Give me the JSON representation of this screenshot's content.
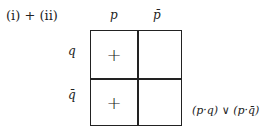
{
  "heading": "(i) + (ii)",
  "columns": [
    "p",
    "p̄"
  ],
  "rows": [
    "q",
    "q̄"
  ],
  "cells": [
    [
      "+",
      ""
    ],
    [
      "+",
      ""
    ]
  ],
  "result": "(p·q) ∨ (p·q̄)"
}
